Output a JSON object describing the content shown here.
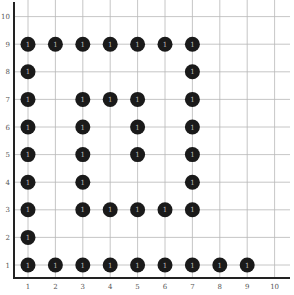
{
  "chart_data": {
    "type": "scatter",
    "title": "",
    "xlabel": "",
    "ylabel": "",
    "xlim": [
      0.5,
      10.5
    ],
    "ylim": [
      0.5,
      10.5
    ],
    "grid": true,
    "x_ticks": [
      "1",
      "2",
      "3",
      "4",
      "5",
      "6",
      "7",
      "8",
      "9",
      "10"
    ],
    "y_ticks": [
      "1",
      "2",
      "3",
      "4",
      "5",
      "6",
      "7",
      "8",
      "9",
      "10"
    ],
    "marker_label": "1",
    "marker_color": "#1a1a1a",
    "points": [
      [
        1,
        9
      ],
      [
        2,
        9
      ],
      [
        3,
        9
      ],
      [
        4,
        9
      ],
      [
        5,
        9
      ],
      [
        6,
        9
      ],
      [
        7,
        9
      ],
      [
        1,
        8
      ],
      [
        7,
        8
      ],
      [
        1,
        7
      ],
      [
        3,
        7
      ],
      [
        4,
        7
      ],
      [
        5,
        7
      ],
      [
        7,
        7
      ],
      [
        1,
        6
      ],
      [
        3,
        6
      ],
      [
        5,
        6
      ],
      [
        7,
        6
      ],
      [
        1,
        5
      ],
      [
        3,
        5
      ],
      [
        5,
        5
      ],
      [
        7,
        5
      ],
      [
        1,
        4
      ],
      [
        3,
        4
      ],
      [
        7,
        4
      ],
      [
        1,
        3
      ],
      [
        3,
        3
      ],
      [
        4,
        3
      ],
      [
        5,
        3
      ],
      [
        6,
        3
      ],
      [
        7,
        3
      ],
      [
        1,
        2
      ],
      [
        1,
        1
      ],
      [
        2,
        1
      ],
      [
        3,
        1
      ],
      [
        4,
        1
      ],
      [
        5,
        1
      ],
      [
        6,
        1
      ],
      [
        7,
        1
      ],
      [
        8,
        1
      ],
      [
        9,
        1
      ]
    ]
  }
}
